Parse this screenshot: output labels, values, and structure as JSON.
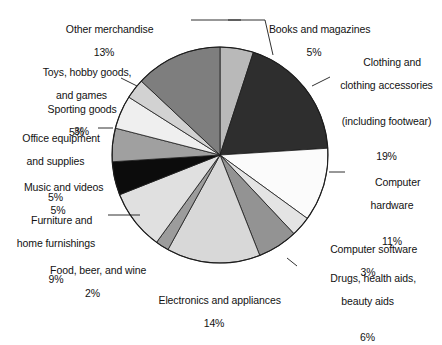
{
  "chart_data": {
    "type": "pie",
    "title": "",
    "subtitle": "",
    "xlabel": "",
    "ylabel": "",
    "legend_position": "callout-labels",
    "grid": false,
    "units": "percent",
    "start_angle_deg": 0,
    "direction": "clockwise",
    "categories": [
      "Books and magazines",
      "Clothing and clothing accessories (including footwear)",
      "Computer hardware",
      "Computer software",
      "Drugs, health aids, beauty aids",
      "Electronics and appliances",
      "Food, beer, and wine",
      "Furniture and home furnishings",
      "Music and videos",
      "Office equipment and supplies",
      "Sporting goods",
      "Toys, hobby goods, and games",
      "Other merchandise"
    ],
    "values": [
      5,
      19,
      11,
      3,
      6,
      14,
      2,
      9,
      5,
      5,
      5,
      3,
      13
    ],
    "slice_colors": [
      "#b9b9b9",
      "#2e2e2e",
      "#fbfbfb",
      "#e4e4e4",
      "#939393",
      "#d8d8d8",
      "#9c9c9c",
      "#e0e0e0",
      "#0c0c0c",
      "#a0a0a0",
      "#efefef",
      "#d2d2d2",
      "#7e7e7e"
    ]
  },
  "labels": [
    {
      "id": "other-merchandise",
      "name": "Other merchandise",
      "percent": "13%",
      "lines": [
        "Other merchandise"
      ],
      "align": "ctr"
    },
    {
      "id": "toys-hobby-goods-and-games",
      "name": "Toys, hobby goods, and games",
      "percent": "3%",
      "lines": [
        "Toys, hobby goods,",
        "and games"
      ],
      "align": "ctr"
    },
    {
      "id": "sporting-goods",
      "name": "Sporting goods",
      "percent": "5%",
      "lines": [
        "Sporting goods"
      ],
      "align": "ctr"
    },
    {
      "id": "office-equipment-and-supplies",
      "name": "Office equipment and supplies",
      "percent": "5%",
      "lines": [
        "Office equipment",
        "and supplies"
      ],
      "align": "ctr"
    },
    {
      "id": "music-and-videos",
      "name": "Music and videos",
      "percent": "5%",
      "lines": [
        "Music and videos"
      ],
      "align": "ctr"
    },
    {
      "id": "furniture-and-home-furnishings",
      "name": "Furniture and home furnishings",
      "percent": "9%",
      "lines": [
        "Furniture and",
        "home furnishings"
      ],
      "align": "ctr"
    },
    {
      "id": "food-beer-and-wine",
      "name": "Food, beer, and wine",
      "percent": "2%",
      "lines": [
        "Food, beer, and wine"
      ],
      "align": "ctr"
    },
    {
      "id": "electronics-and-appliances",
      "name": "Electronics and appliances",
      "percent": "14%",
      "lines": [
        "Electronics and appliances"
      ],
      "align": "ctr"
    },
    {
      "id": "drugs-health-aids-beauty-aids",
      "name": "Drugs, health aids, beauty aids",
      "percent": "6%",
      "lines": [
        "Drugs, health aids,",
        "beauty aids"
      ],
      "align": "ctr"
    },
    {
      "id": "computer-software",
      "name": "Computer software",
      "percent": "3%",
      "lines": [
        "Computer software"
      ],
      "align": "ctr"
    },
    {
      "id": "computer-hardware",
      "name": "Computer hardware",
      "percent": "11%",
      "lines": [
        "Computer",
        "hardware"
      ],
      "align": "ctr"
    },
    {
      "id": "clothing-and-clothing-accessories",
      "name": "Clothing and clothing accessories (including footwear)",
      "percent": "19%",
      "lines": [
        "Clothing and",
        "clothing accessories",
        "(including footwear)"
      ],
      "align": "ctr"
    },
    {
      "id": "books-and-magazines",
      "name": "Books and magazines",
      "percent": "5%",
      "lines": [
        "Books and magazines"
      ],
      "align": "ctr"
    }
  ]
}
